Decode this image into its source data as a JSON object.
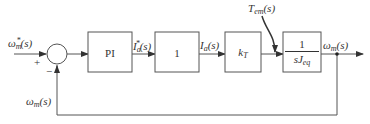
{
  "diagram": {
    "type": "block-diagram",
    "colors": {
      "line": "#555555",
      "text": "#333333",
      "background": "#ffffff"
    },
    "input": {
      "symbol": "ω",
      "sub": "m",
      "sup": "*",
      "arg": "(s)"
    },
    "summing_junction": {
      "plus_sign": "+",
      "minus_sign": "−"
    },
    "blocks": [
      {
        "id": "pi",
        "label": "PI"
      },
      {
        "id": "gain1",
        "label": "1"
      },
      {
        "id": "kt",
        "symbol": "k",
        "sub": "T"
      },
      {
        "id": "plant",
        "numerator": "1",
        "denominator_symbol": "sJ",
        "denominator_sub": "eq"
      }
    ],
    "signals": {
      "ia_ref": {
        "symbol": "I",
        "sub": "a",
        "sup": "*",
        "arg": "(s)"
      },
      "ia": {
        "symbol": "I",
        "sub": "a",
        "arg": "(s)"
      },
      "disturbance": {
        "symbol": "T",
        "sub": "em",
        "arg": "(s)"
      },
      "output": {
        "symbol": "ω",
        "sub": "m",
        "arg": "(s)"
      },
      "feedback": {
        "symbol": "ω",
        "sub": "m",
        "arg": "(s)"
      }
    }
  }
}
